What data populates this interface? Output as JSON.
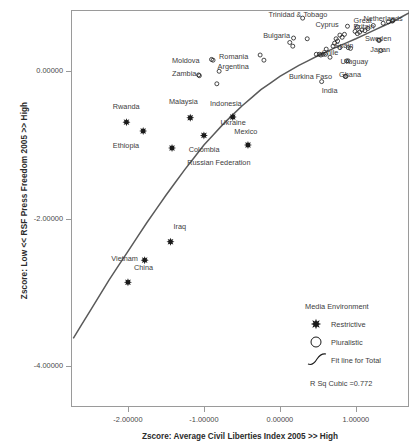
{
  "chart_data": {
    "type": "scatter",
    "title": "",
    "xlabel": "Zscore:  Average Civil Liberties Index 2005 >> High",
    "ylabel": "Zscore: Low << RSF Press Freedom 2005 >> High",
    "xlim": [
      -2.75,
      1.7
    ],
    "ylim": [
      -4.55,
      0.83
    ],
    "xticks": [
      -2.0,
      -1.0,
      0.0,
      1.0
    ],
    "xticklabels": [
      "-2.00000",
      "-1.00000",
      "0.00000",
      "1.00000"
    ],
    "yticks": [
      0.0,
      -2.0,
      -4.0
    ],
    "yticklabels": [
      "0.00000",
      "-2.00000",
      "-4.00000"
    ],
    "grid": false,
    "annotation": "R Sq Cubic =0.772",
    "legend": {
      "position": "bottom-right",
      "title": "Media Environment",
      "entries": [
        {
          "label": "Restrictive",
          "marker": "restrictive-star-icon"
        },
        {
          "label": "Pluralistic",
          "marker": "pluralistic-circle-icon"
        },
        {
          "label": "Fit line for Total",
          "marker": "fit-line-icon"
        }
      ]
    },
    "series": [
      {
        "name": "Restrictive",
        "marker": "filled-star",
        "points": [
          {
            "label": "Rwanda",
            "x": -2.02,
            "y": -0.69,
            "lx": -2.2,
            "ly": -0.5
          },
          {
            "label": "Ethiopia",
            "x": -1.8,
            "y": -0.81,
            "lx": -2.2,
            "ly": -1.03
          },
          {
            "label": "Malaysia",
            "x": -1.18,
            "y": -0.63,
            "lx": -1.46,
            "ly": -0.43
          },
          {
            "label": "Colombia",
            "x": -1.0,
            "y": -0.87,
            "lx": -1.2,
            "ly": -1.08
          },
          {
            "label": "Russian Federation",
            "x": -1.42,
            "y": -1.04,
            "lx": -1.22,
            "ly": -1.26
          },
          {
            "label": "Indonesia",
            "x": -0.62,
            "y": -0.62,
            "lx": -0.92,
            "ly": -0.45
          },
          {
            "label": "Mexico",
            "x": -0.42,
            "y": -1.0,
            "lx": -0.6,
            "ly": -0.83
          },
          {
            "label": "Ukraine",
            "x": -0.62,
            "y": -0.62,
            "lx": -0.78,
            "ly": -0.72
          },
          {
            "label": "Iraq",
            "x": -1.44,
            "y": -2.31,
            "lx": -1.4,
            "ly": -2.12
          },
          {
            "label": "Vietnam",
            "x": -1.78,
            "y": -2.56,
            "lx": -2.22,
            "ly": -2.56
          },
          {
            "label": "China",
            "x": -2.0,
            "y": -2.86,
            "lx": -1.92,
            "ly": -2.68
          }
        ]
      },
      {
        "name": "Pluralistic",
        "marker": "open-circle",
        "points": [
          {
            "label": "Trinidad & Tobago",
            "x": 0.3,
            "y": 0.72,
            "lx": -0.15,
            "ly": 0.75
          },
          {
            "label": "Netherlands",
            "x": 1.49,
            "y": 0.69,
            "lx": 1.1,
            "ly": 0.7
          },
          {
            "label": "Cyprus",
            "x": 0.89,
            "y": 0.61,
            "lx": 0.47,
            "ly": 0.62
          },
          {
            "label": "Great",
            "x": 1.02,
            "y": 0.6,
            "lx": 0.97,
            "ly": 0.67
          },
          {
            "label": "Britain",
            "x": 1.02,
            "y": 0.6,
            "lx": 0.97,
            "ly": 0.58
          },
          {
            "label": "Bulgaria",
            "x": 0.18,
            "y": 0.45,
            "lx": -0.22,
            "ly": 0.47
          },
          {
            "label": "Sweden",
            "x": 1.3,
            "y": 0.42,
            "lx": 1.12,
            "ly": 0.42
          },
          {
            "label": "Spain",
            "x": 0.79,
            "y": 0.32,
            "lx": 0.72,
            "ly": 0.33
          },
          {
            "label": "Japan",
            "x": 1.33,
            "y": 0.28,
            "lx": 1.19,
            "ly": 0.27
          },
          {
            "label": "Chile",
            "x": 0.54,
            "y": 0.22,
            "lx": 0.55,
            "ly": 0.23
          },
          {
            "label": "Romania",
            "x": -0.9,
            "y": 0.16,
            "lx": -0.8,
            "ly": 0.18
          },
          {
            "label": "Uruguay",
            "x": 0.9,
            "y": 0.14,
            "lx": 0.8,
            "ly": 0.11
          },
          {
            "label": "Moldova",
            "x": -0.9,
            "y": 0.16,
            "lx": -1.42,
            "ly": 0.12
          },
          {
            "label": "Argentina",
            "x": -0.8,
            "y": 0.0,
            "lx": -0.82,
            "ly": 0.04
          },
          {
            "label": "Zambia",
            "x": -1.06,
            "y": -0.06,
            "lx": -1.42,
            "ly": -0.05
          },
          {
            "label": "Ghana",
            "x": 0.86,
            "y": -0.07,
            "lx": 0.78,
            "ly": -0.07
          },
          {
            "label": "Burkina Faso",
            "x": 0.55,
            "y": -0.14,
            "lx": 0.12,
            "ly": -0.09
          },
          {
            "label": "India",
            "x": 0.55,
            "y": -0.14,
            "lx": 0.55,
            "ly": -0.28
          }
        ]
      }
    ],
    "unlabeled_pluralistic_points": [
      {
        "x": -0.88,
        "y": 0.15
      },
      {
        "x": -1.07,
        "y": -0.05
      },
      {
        "x": -0.83,
        "y": -0.17
      },
      {
        "x": -0.26,
        "y": 0.22
      },
      {
        "x": -0.21,
        "y": 0.15
      },
      {
        "x": 0.13,
        "y": 0.39
      },
      {
        "x": 0.17,
        "y": 0.34
      },
      {
        "x": 0.36,
        "y": 0.44
      },
      {
        "x": 0.48,
        "y": 0.23
      },
      {
        "x": 0.52,
        "y": 0.23
      },
      {
        "x": 0.61,
        "y": 0.3
      },
      {
        "x": 0.66,
        "y": 0.19
      },
      {
        "x": 0.7,
        "y": 0.34
      },
      {
        "x": 0.72,
        "y": 0.38
      },
      {
        "x": 0.74,
        "y": 0.44
      },
      {
        "x": 0.76,
        "y": 0.41
      },
      {
        "x": 0.79,
        "y": 0.49
      },
      {
        "x": 0.82,
        "y": 0.46
      },
      {
        "x": 0.85,
        "y": 0.5
      },
      {
        "x": 0.88,
        "y": 0.14
      },
      {
        "x": 0.9,
        "y": 0.32
      },
      {
        "x": 0.93,
        "y": 0.31
      },
      {
        "x": 0.99,
        "y": 0.54
      },
      {
        "x": 1.02,
        "y": 0.51
      },
      {
        "x": 1.05,
        "y": 0.53
      },
      {
        "x": 1.08,
        "y": 0.56
      },
      {
        "x": 1.12,
        "y": 0.55
      },
      {
        "x": 1.16,
        "y": 0.58
      },
      {
        "x": 1.23,
        "y": 0.62
      },
      {
        "x": 1.31,
        "y": 0.42
      },
      {
        "x": 1.36,
        "y": 0.65
      },
      {
        "x": 1.43,
        "y": 0.67
      },
      {
        "x": 1.48,
        "y": 0.68
      },
      {
        "x": 0.57,
        "y": 0.23
      },
      {
        "x": 0.6,
        "y": 0.23
      },
      {
        "x": 0.87,
        "y": -0.07
      },
      {
        "x": 0.55,
        "y": -0.14
      },
      {
        "x": 0.3,
        "y": 0.72
      }
    ],
    "fit_line": {
      "name": "Fit line for Total",
      "points": [
        {
          "x": -2.72,
          "y": -3.62
        },
        {
          "x": -2.5,
          "y": -3.25
        },
        {
          "x": -2.25,
          "y": -2.83
        },
        {
          "x": -2.0,
          "y": -2.44
        },
        {
          "x": -1.75,
          "y": -2.05
        },
        {
          "x": -1.5,
          "y": -1.68
        },
        {
          "x": -1.25,
          "y": -1.33
        },
        {
          "x": -1.0,
          "y": -1.0
        },
        {
          "x": -0.75,
          "y": -0.72
        },
        {
          "x": -0.5,
          "y": -0.47
        },
        {
          "x": -0.25,
          "y": -0.25
        },
        {
          "x": 0.0,
          "y": -0.07
        },
        {
          "x": 0.25,
          "y": 0.08
        },
        {
          "x": 0.5,
          "y": 0.21
        },
        {
          "x": 0.75,
          "y": 0.33
        },
        {
          "x": 1.0,
          "y": 0.44
        },
        {
          "x": 1.25,
          "y": 0.56
        },
        {
          "x": 1.5,
          "y": 0.68
        },
        {
          "x": 1.7,
          "y": 0.79
        }
      ]
    },
    "colors": {
      "marker": "#1a1a1a",
      "fit_line": "#5a5a5a",
      "frame": "#9a9a9a",
      "text": "#3c3c3c",
      "background": "#ffffff"
    }
  }
}
